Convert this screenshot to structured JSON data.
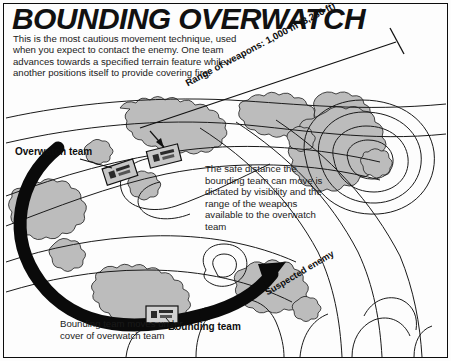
{
  "page": {
    "title": "BOUNDING OVERWATCH",
    "border_color": "#0d0d0d",
    "background": "#ffffff"
  },
  "intro": {
    "text": "This is the most cautious movement technique, used when you expect to contact the enemy. One team advances towards a specified terrain feature while another positions itself to provide covering fire."
  },
  "annotations": {
    "range_label": "Range of weapons: 1,000 m (3,280 ft)",
    "overwatch_label": "Overwatch team",
    "bounding_label": "Bounding team",
    "suspected_enemy_label": "Suspected enemy",
    "safe_distance_note": "The safe distance the bounding team can move is dictated by visibility and the range of the weapons available to the overwatch team",
    "bounding_note": "Bounding team moves under cover of overwatch team"
  },
  "colors": {
    "ink": "#0d0d0d",
    "vegetation_fill": "#b9b9b9",
    "vegetation_fill_light": "#cfcfcf",
    "contour_line": "#1a1a1a",
    "arrow": "#0a0a0a",
    "paper": "#ffffff"
  },
  "map": {
    "terrain_type": "contour-map",
    "features": [
      "ridge-contours",
      "hill-contours",
      "vegetation-patches",
      "movement-arrow",
      "overwatch-figures",
      "bounding-figure"
    ]
  }
}
